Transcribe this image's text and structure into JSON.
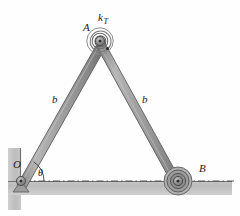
{
  "figure": {
    "type": "mechanism-diagram",
    "background_color": "#fefefe",
    "ground_color": "#b9b9b9",
    "link_color": "#a6a6a6",
    "link_edge_color": "#5a5a5a",
    "line_color": "#404040",
    "label_color": "#1a1a1a"
  },
  "labels": {
    "apex_joint": "A",
    "spring": "k",
    "spring_sub": "T",
    "left_link": "b",
    "right_link": "b",
    "pivot": "O",
    "angle": "θ",
    "roller": "B"
  },
  "geometry": {
    "pivot_O": {
      "x": 21,
      "y": 181
    },
    "apex_A": {
      "x": 100,
      "y": 41
    },
    "roller_B": {
      "x": 178,
      "y": 181
    },
    "link_length_label": "b",
    "datum_y": 181,
    "angle_deg": 60
  },
  "elements": {
    "wall": "vertical-hatched-support",
    "ground": "horizontal-hatched-support",
    "datum": "dash-dot-centerline",
    "spring_turns": 4,
    "pin_joint_O": "pin-support",
    "roller_joint_B": "roller-support"
  }
}
